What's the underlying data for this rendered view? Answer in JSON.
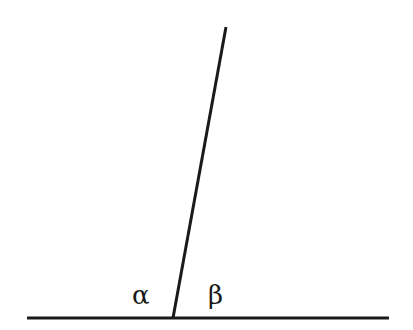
{
  "diagram": {
    "type": "angles-on-a-straight-line",
    "labels": {
      "alpha": "α",
      "beta": "β"
    },
    "line_color": "#1a1a1a",
    "horizontal_line": {
      "x1": 27,
      "y1": 318,
      "x2": 389,
      "y2": 318
    },
    "oblique_line": {
      "x1": 226,
      "y1": 27,
      "x2": 173,
      "y2": 318
    }
  }
}
